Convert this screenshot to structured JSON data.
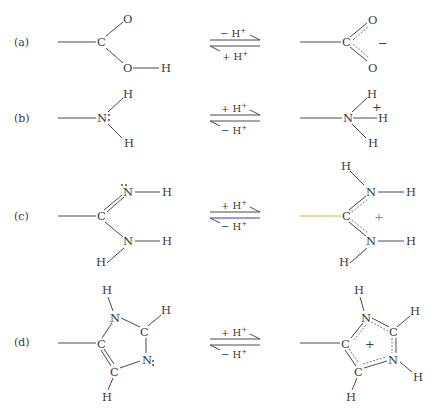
{
  "figure": {
    "colors": {
      "ink": "#3a3a3a",
      "bond": "#4a4a4a",
      "highlight_yellow": "#c8c020",
      "highlight_purple": "#8a70e0",
      "highlight_teal": "#40b0a0"
    },
    "rows": [
      {
        "label": "(a)",
        "group": "carboxylic acid / carboxylate",
        "forward_top": "− H",
        "forward_sup": "+",
        "reverse_bottom": "+ H",
        "reverse_sup": "+",
        "left_atoms": [
          "C",
          "O",
          "O",
          "H"
        ],
        "right_atoms": [
          "C",
          "O",
          "O"
        ],
        "right_charge": "−"
      },
      {
        "label": "(b)",
        "group": "amine / ammonium",
        "forward_top": "+ H",
        "forward_sup": "+",
        "reverse_bottom": "− H",
        "reverse_sup": "+",
        "left_atoms": [
          "N",
          "H",
          "H"
        ],
        "right_atoms": [
          "N",
          "H",
          "H",
          "H"
        ],
        "right_charge": "+"
      },
      {
        "label": "(c)",
        "group": "guanidino / amidine",
        "forward_top": "+ H",
        "forward_sup": "+",
        "reverse_bottom": "− H",
        "reverse_sup": "+",
        "left_atoms": [
          "C",
          "N",
          "H",
          "N",
          "H",
          "H"
        ],
        "right_atoms": [
          "C",
          "H",
          "N",
          "H",
          "N",
          "H",
          "H"
        ],
        "right_charge": "+"
      },
      {
        "label": "(d)",
        "group": "imidazole / imidazolium",
        "forward_top": "+ H",
        "forward_sup": "+",
        "reverse_bottom": "− H",
        "reverse_sup": "+",
        "left_atoms": [
          "H",
          "N",
          "C",
          "H",
          "C",
          "N",
          "C",
          "H"
        ],
        "right_atoms": [
          "H",
          "N",
          "C",
          "H",
          "C",
          "N",
          "H",
          "C",
          "H"
        ],
        "right_charge": "+"
      }
    ]
  }
}
